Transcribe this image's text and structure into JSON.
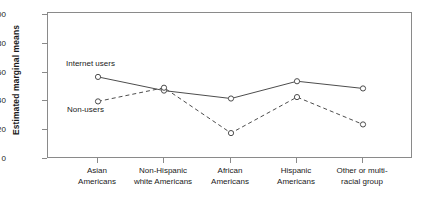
{
  "chart_data": {
    "type": "line",
    "title": "",
    "xlabel": "",
    "ylabel": "Estimated marginal means",
    "ylim": [
      0,
      100
    ],
    "yticks": [
      0,
      20,
      40,
      60,
      80,
      100
    ],
    "grid": false,
    "legend_position": "inline-annotations",
    "categories": [
      "Asian\nAmericans",
      "Non-Hispanic\nwhite Americans",
      "African\nAmericans",
      "Hispanic\nAmericans",
      "Other or multi-\nracial group"
    ],
    "category_lines": [
      [
        "Asian",
        "Americans"
      ],
      [
        "Non-Hispanic",
        "white Americans"
      ],
      [
        "African",
        "Americans"
      ],
      [
        "Hispanic",
        "Americans"
      ],
      [
        "Other or multi-",
        "racial group"
      ]
    ],
    "series": [
      {
        "name": "Internet users",
        "style": "solid",
        "marker": "open-circle",
        "color": "#4d4d4d",
        "values": [
          57,
          47.5,
          42,
          54,
          49
        ]
      },
      {
        "name": "Non-users",
        "style": "dashed",
        "marker": "open-circle",
        "color": "#4d4d4d",
        "values": [
          40,
          49.5,
          18,
          43,
          24
        ]
      }
    ],
    "annotations": [
      {
        "text": "Internet users",
        "series": "Internet users"
      },
      {
        "text": "Non-users",
        "series": "Non-users"
      }
    ]
  },
  "axis": {
    "y_tick_labels": [
      "100",
      "80",
      "60",
      "40",
      "20",
      "0"
    ],
    "y_title": "Estimated marginal means"
  },
  "colors": {
    "frame": "#8a8a8a",
    "line": "#4d4d4d",
    "text": "#1a1a1a",
    "background": "#ffffff"
  }
}
